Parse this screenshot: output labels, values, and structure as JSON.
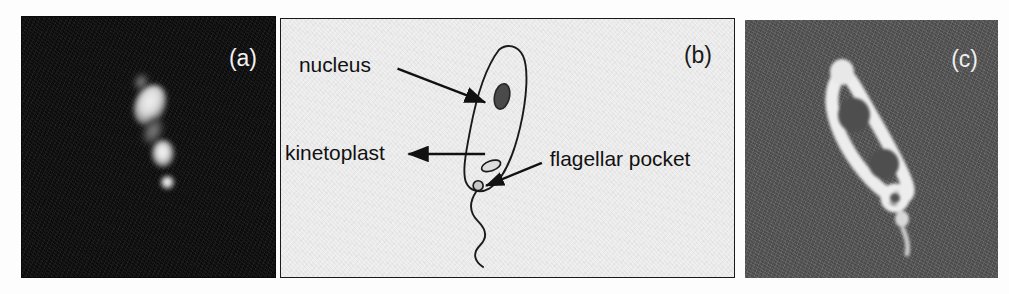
{
  "figure": {
    "background_color": "#ffffff",
    "width": 1009,
    "height": 294
  },
  "panels": [
    {
      "id": "a",
      "letter": "(a)",
      "type": "fluorescence-micrograph",
      "description": "Dark-field DAPI fluorescence image showing three bright stained bodies along a diagonal axis",
      "background_color": "#0a0a0a",
      "label_color": "#f2f2f2",
      "features": [
        {
          "name": "nucleus",
          "appearance": "large bright elongated blob"
        },
        {
          "name": "kinetoplast",
          "appearance": "medium bright blob"
        },
        {
          "name": "flagellar-pocket",
          "appearance": "small bright dot"
        }
      ]
    },
    {
      "id": "b",
      "letter": "(b)",
      "type": "schematic-diagram",
      "description": "Line drawing of an elongated trypanosome cell with labelled organelles and a wavy flagellum",
      "background_color": "#efefef",
      "border_color": "#1a1a1a",
      "label_color": "#111111",
      "labels": [
        {
          "text": "nucleus",
          "arrow": "points right and down to nucleus oval"
        },
        {
          "text": "kinetoplast",
          "arrow": "points left from kinetoplast oval"
        },
        {
          "text": "flagellar pocket",
          "arrow": "points up and left to the pocket circle"
        }
      ],
      "structures": [
        {
          "name": "cell-body",
          "appearance": "elongated teardrop outline, tilted"
        },
        {
          "name": "nucleus",
          "appearance": "dark filled oval in upper cell body"
        },
        {
          "name": "kinetoplast",
          "appearance": "small light oval with outline, lower cell body"
        },
        {
          "name": "flagellar-pocket",
          "appearance": "small circle at posterior notch"
        },
        {
          "name": "flagellum",
          "appearance": "long wavy line trailing downward"
        }
      ]
    },
    {
      "id": "c",
      "letter": "(c)",
      "type": "fluorescence-micrograph",
      "description": "Grey-field image showing a brightly outlined cell with two dark internal voids and a trailing flagellum",
      "background_color": "#565656",
      "label_color": "#efefef",
      "features": [
        {
          "name": "cell-body-outline",
          "appearance": "bright rim around elongated cell"
        },
        {
          "name": "nucleus",
          "appearance": "dark round void, upper"
        },
        {
          "name": "kinetoplast",
          "appearance": "dark round void, lower"
        },
        {
          "name": "flagellar-pocket",
          "appearance": "small bright ring below cell body"
        },
        {
          "name": "flagellum",
          "appearance": "faint bright streak trailing downward"
        }
      ]
    }
  ]
}
